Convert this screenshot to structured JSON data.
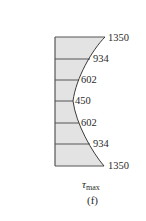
{
  "figure": {
    "label": "(f)",
    "quantity_symbol": "τ",
    "quantity_subscript": "max",
    "fill_color": "#e3e3e3",
    "stroke_color": "#3a3a3a"
  },
  "stations": [
    {
      "value": "1350",
      "y": 37,
      "curve_x": 105
    },
    {
      "value": "934",
      "y": 59,
      "curve_x": 90
    },
    {
      "value": "602",
      "y": 80,
      "curve_x": 79
    },
    {
      "value": "450",
      "y": 101,
      "curve_x": 73
    },
    {
      "value": "602",
      "y": 123,
      "curve_x": 79
    },
    {
      "value": "934",
      "y": 144,
      "curve_x": 90
    },
    {
      "value": "1350",
      "y": 166,
      "curve_x": 104
    }
  ]
}
